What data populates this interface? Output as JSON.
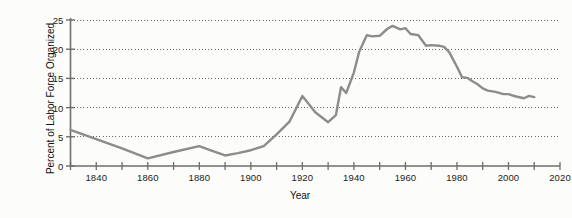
{
  "chart_data": {
    "type": "line",
    "title": "",
    "xlabel": "Year",
    "ylabel": "Percent of Labor Force Organized",
    "xlim": [
      1830,
      2020
    ],
    "ylim": [
      0,
      25
    ],
    "grid": "horizontal-dotted",
    "legend": "none",
    "x_ticks_major": [
      1840,
      1860,
      1880,
      1900,
      1920,
      1940,
      1960,
      1980,
      2000,
      2020
    ],
    "x_ticks_minor": [
      1830,
      1850,
      1870,
      1890,
      1910,
      1930,
      1950,
      1970,
      1990,
      2010
    ],
    "y_ticks": [
      0,
      5,
      10,
      15,
      20,
      25
    ],
    "series": [
      {
        "name": "Percent of Labor Force Organized",
        "color": "#8c8c8c",
        "line_width": 2.4,
        "x": [
          1830,
          1840,
          1850,
          1860,
          1870,
          1880,
          1885,
          1890,
          1895,
          1900,
          1905,
          1910,
          1915,
          1920,
          1925,
          1930,
          1933,
          1935,
          1937,
          1940,
          1942,
          1945,
          1947,
          1950,
          1953,
          1955,
          1958,
          1960,
          1962,
          1965,
          1968,
          1970,
          1973,
          1975,
          1977,
          1980,
          1982,
          1984,
          1986,
          1988,
          1990,
          1992,
          1995,
          1998,
          2000,
          2003,
          2006,
          2008,
          2010
        ],
        "y": [
          6.2,
          4.6,
          3.0,
          1.3,
          2.4,
          3.4,
          2.6,
          1.8,
          2.2,
          2.7,
          3.4,
          5.4,
          7.6,
          12.0,
          9.2,
          7.5,
          8.7,
          13.5,
          12.5,
          16.0,
          19.5,
          22.4,
          22.2,
          22.3,
          23.5,
          24.0,
          23.4,
          23.6,
          22.6,
          22.4,
          20.6,
          20.7,
          20.6,
          20.4,
          19.5,
          17.0,
          15.2,
          15.1,
          14.5,
          14.0,
          13.3,
          12.9,
          12.7,
          12.3,
          12.3,
          11.9,
          11.6,
          12.0,
          11.8
        ]
      }
    ],
    "colors": {
      "line": "#8c8c8c",
      "axis": "#6e6e6e",
      "gridline": "#6a6a6a",
      "text": "#1b1b1b",
      "background": "#fcfcfa"
    }
  },
  "axes": {
    "x_title": "Year",
    "y_title": "Percent of Labor Force Organized",
    "x_tick_labels": [
      "1840",
      "1860",
      "1880",
      "1900",
      "1920",
      "1940",
      "1960",
      "1980",
      "2000",
      "2020"
    ],
    "y_tick_labels": [
      "0",
      "5",
      "10",
      "15",
      "20",
      "25"
    ]
  }
}
